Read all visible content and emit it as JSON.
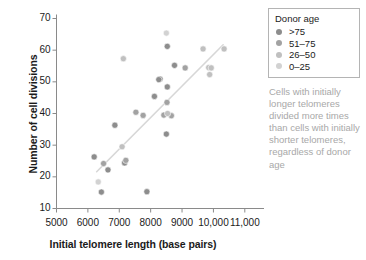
{
  "chart_data": {
    "type": "scatter",
    "title": "",
    "xlabel": "Initial telomere length (base pairs)",
    "ylabel": "Number of cell divisions",
    "xlim": [
      5000,
      11500
    ],
    "ylim": [
      10,
      70
    ],
    "grid": false,
    "xticks": [
      {
        "value": 5000,
        "label": "5000"
      },
      {
        "value": 6000,
        "label": "6000"
      },
      {
        "value": 7000,
        "label": "7000"
      },
      {
        "value": 8000,
        "label": "8000"
      },
      {
        "value": 9000,
        "label": "9000"
      },
      {
        "value": 10000,
        "label": "10,000"
      },
      {
        "value": 11000,
        "label": "11,000"
      }
    ],
    "yticks": [
      {
        "value": 10,
        "label": "10"
      },
      {
        "value": 20,
        "label": "20"
      },
      {
        "value": 30,
        "label": "30"
      },
      {
        "value": 40,
        "label": "40"
      },
      {
        "value": 50,
        "label": "50"
      },
      {
        "value": 60,
        "label": "60"
      },
      {
        "value": 70,
        "label": "70"
      }
    ],
    "legend": {
      "title": "Donor age",
      "position": "top-right",
      "entries": [
        {
          "label": ">75",
          "color": "#8d8d8d"
        },
        {
          "label": "51–75",
          "color": "#a2a2a2"
        },
        {
          "label": "26–50",
          "color": "#c0c0c0"
        },
        {
          "label": "0–25",
          "color": "#d2d2d2"
        }
      ]
    },
    "trendline": {
      "color": "#d7d7d7",
      "x_start": 6280,
      "y_start": 21.6,
      "x_end": 10310,
      "y_end": 61.7
    },
    "series": [
      {
        "name": ">75",
        "color": "#8d8d8d",
        "points": [
          {
            "x": 6200,
            "y": 26.3
          },
          {
            "x": 6640,
            "y": 22.2
          },
          {
            "x": 6430,
            "y": 15.2
          },
          {
            "x": 6860,
            "y": 36.3
          },
          {
            "x": 7170,
            "y": 24.4
          },
          {
            "x": 7880,
            "y": 15.3
          },
          {
            "x": 8120,
            "y": 45.4
          },
          {
            "x": 8300,
            "y": 50.9
          },
          {
            "x": 8260,
            "y": 50.7
          },
          {
            "x": 8500,
            "y": 33.5
          },
          {
            "x": 8530,
            "y": 48.4
          },
          {
            "x": 8760,
            "y": 55.2
          },
          {
            "x": 8530,
            "y": 61.2
          }
        ]
      },
      {
        "name": "51–75",
        "color": "#a2a2a2",
        "points": [
          {
            "x": 6500,
            "y": 24.2
          },
          {
            "x": 7210,
            "y": 25.2
          },
          {
            "x": 7530,
            "y": 40.4
          },
          {
            "x": 7760,
            "y": 39.4
          },
          {
            "x": 8420,
            "y": 39.5
          },
          {
            "x": 8520,
            "y": 43.5
          },
          {
            "x": 8660,
            "y": 39.3
          },
          {
            "x": 9100,
            "y": 54.4
          }
        ]
      },
      {
        "name": "26–50",
        "color": "#c0c0c0",
        "points": [
          {
            "x": 7090,
            "y": 29.5
          },
          {
            "x": 7130,
            "y": 57.3
          },
          {
            "x": 8540,
            "y": 40.0
          },
          {
            "x": 9670,
            "y": 60.4
          },
          {
            "x": 9850,
            "y": 54.5
          },
          {
            "x": 9930,
            "y": 54.4
          },
          {
            "x": 9880,
            "y": 52.3
          },
          {
            "x": 10340,
            "y": 60.4
          }
        ]
      },
      {
        "name": "0–25",
        "color": "#d2d2d2",
        "points": [
          {
            "x": 6330,
            "y": 18.4
          },
          {
            "x": 8500,
            "y": 65.4
          }
        ]
      }
    ]
  },
  "annotation": {
    "text": "Cells with initially longer telomeres divided more times than cells with initially shorter telomeres, regardless of donor age",
    "color": "#a8a8a8"
  },
  "axis_style": {
    "line_color": "#8a8a8a",
    "text_color": "#1b1b1b"
  }
}
